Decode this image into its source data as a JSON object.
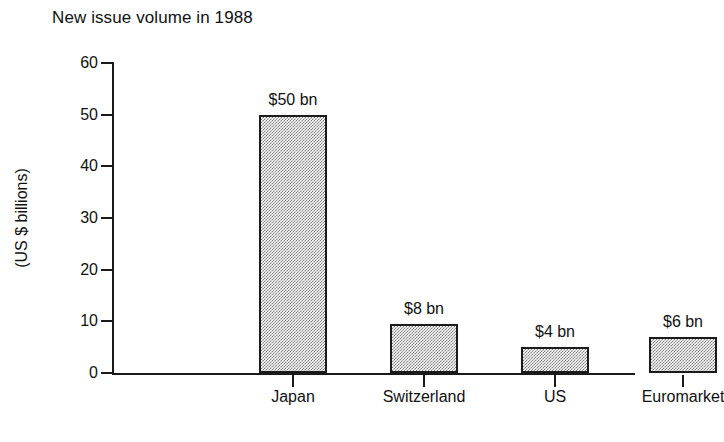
{
  "chart_data": {
    "type": "bar",
    "title": "New issue volume in 1988",
    "xlabel": "",
    "ylabel": "(US $ billions)",
    "categories": [
      "Japan",
      "Switzerland",
      "US",
      "Euromarket"
    ],
    "values": [
      50,
      8,
      4,
      6
    ],
    "value_labels": [
      "$50 bn",
      "$8 bn",
      "$4 bn",
      "$6 bn"
    ],
    "ylim": [
      0,
      60
    ],
    "yticks": [
      0,
      10,
      20,
      30,
      40,
      50,
      60
    ],
    "ytick_labels": [
      "0",
      "10",
      "20",
      "30",
      "40",
      "50",
      "60"
    ],
    "grid": false,
    "legend": false,
    "legend_position": "none",
    "bar_fill_color": "#b8b8b8",
    "bar_edge_color": "#1a1a1a",
    "background_color": "#ffffff",
    "text_color": "#111111"
  }
}
